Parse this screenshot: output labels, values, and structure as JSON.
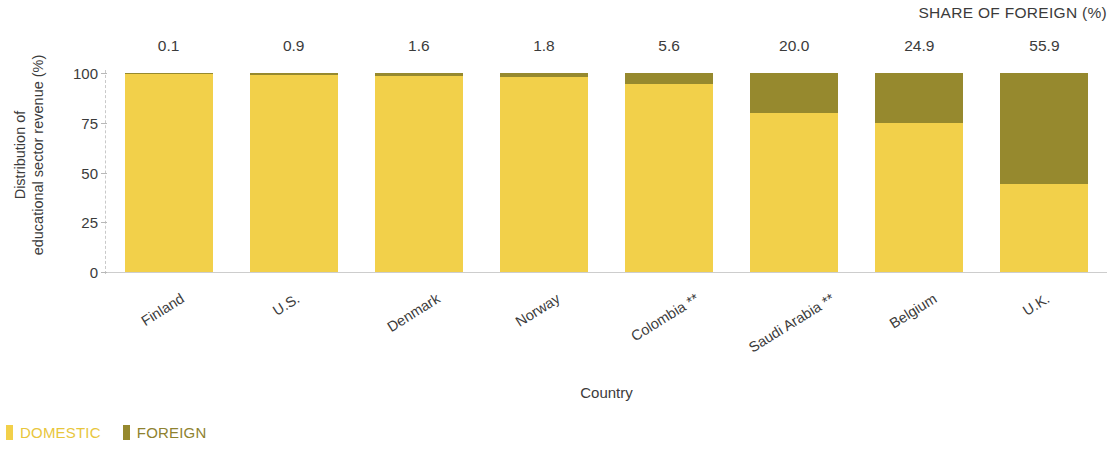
{
  "header": {
    "share_title": "SHARE OF FOREIGN (%)"
  },
  "axes": {
    "ylabel_line1": "Distribution of",
    "ylabel_line2": "educational sector revenue (%)",
    "xlabel": "Country",
    "yticks": [
      "100",
      "75",
      "50",
      "25",
      "0"
    ]
  },
  "legend": {
    "items": [
      {
        "label": "DOMESTIC",
        "color": "#f2d04a"
      },
      {
        "label": "FOREIGN",
        "color": "#96892e"
      }
    ]
  },
  "colors": {
    "domestic": "#f2d04a",
    "foreign": "#96892e",
    "text": "#3b3b3b",
    "axis": "#c9c9c9"
  },
  "chart_data": {
    "type": "bar",
    "title": "",
    "subtitle": "",
    "xlabel": "Country",
    "ylabel": "Distribution of educational sector revenue (%)",
    "ylim": [
      0,
      100
    ],
    "yticks": [
      0,
      25,
      50,
      75,
      100
    ],
    "grid": false,
    "stacked": true,
    "legend_position": "bottom-left",
    "annotation_header": "SHARE OF FOREIGN (%)",
    "categories": [
      "Finland",
      "U.S.",
      "Denmark",
      "Norway",
      "Colombia **",
      "Saudi Arabia **",
      "Belgium",
      "U.K."
    ],
    "bar_value_labels": [
      "0.1",
      "0.9",
      "1.6",
      "1.8",
      "5.6",
      "20.0",
      "24.9",
      "55.9"
    ],
    "series": [
      {
        "name": "DOMESTIC",
        "color": "#f2d04a",
        "values": [
          99.9,
          99.1,
          98.4,
          98.2,
          94.4,
          80.0,
          75.1,
          44.1
        ]
      },
      {
        "name": "FOREIGN",
        "color": "#96892e",
        "values": [
          0.1,
          0.9,
          1.6,
          1.8,
          5.6,
          20.0,
          24.9,
          55.9
        ]
      }
    ]
  }
}
